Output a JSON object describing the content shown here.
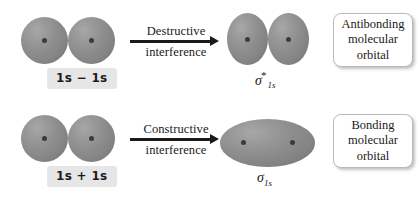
{
  "figure": {
    "background_color": "#ffffff",
    "orbital_color": "#8e8e8e",
    "nucleus_dot_color": "#3b3b3b",
    "label_chip_color": "#e6e6e6",
    "arrow_color": "#1a1a1a",
    "callout_border_color": "#b9b9b9"
  },
  "rows": [
    {
      "id": "antibonding",
      "input_label": "1s − 1s",
      "arrow": {
        "label_top": "Destructive",
        "label_bottom": "interference",
        "direction": "right"
      },
      "product": {
        "symbol_sigma": "σ",
        "symbol_star": "*",
        "symbol_subscript": "1s",
        "shape": "two-vertical-ellipses",
        "lobe_count": 2,
        "nuclei": 2
      },
      "callout_lines": [
        "Antibonding",
        "molecular",
        "orbital"
      ]
    },
    {
      "id": "bonding",
      "input_label": "1s + 1s",
      "arrow": {
        "label_top": "Constructive",
        "label_bottom": "interference",
        "direction": "right"
      },
      "product": {
        "symbol_sigma": "σ",
        "symbol_star": "",
        "symbol_subscript": "1s",
        "shape": "single-horizontal-ellipse",
        "lobe_count": 1,
        "nuclei": 2
      },
      "callout_lines": [
        "Bonding",
        "molecular",
        "orbital"
      ]
    }
  ]
}
